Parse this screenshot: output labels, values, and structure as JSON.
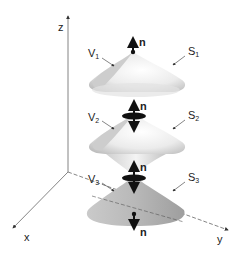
{
  "figure": {
    "axes": {
      "z": "z",
      "x": "x",
      "y": "y"
    },
    "normal_label": "n",
    "volumes": [
      {
        "main": "V",
        "sub": "1"
      },
      {
        "main": "V",
        "sub": "2"
      },
      {
        "main": "V",
        "sub": "3"
      }
    ],
    "surfaces": [
      {
        "main": "S",
        "sub": "1"
      },
      {
        "main": "S",
        "sub": "2"
      },
      {
        "main": "S",
        "sub": "3"
      }
    ],
    "colors": {
      "surface_light": "#f2f2f2",
      "surface_mid": "#d0d0d0",
      "surface_dark": "#a8a8a8",
      "ink": "#111111",
      "axis": "#555555"
    }
  }
}
